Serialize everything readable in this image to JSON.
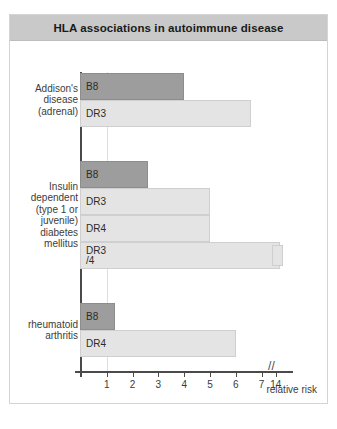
{
  "figure": {
    "title": "HLA associations in autoimmune disease",
    "axis_caption": "relative risk"
  },
  "chart_data": {
    "type": "bar",
    "orientation": "horizontal",
    "title": "HLA associations in autoimmune disease",
    "xlabel": "relative risk",
    "ylabel": "",
    "xlim": [
      0,
      7.9
    ],
    "xticks": [
      "1",
      "2",
      "3",
      "4",
      "5",
      "6",
      "7",
      "14"
    ],
    "axis_break": true,
    "axis_break_note": "//",
    "grid": "single vertical gridline at relative risk = 1",
    "groups": [
      {
        "label": "Addison's\ndisease\n(adrenal)",
        "bars": [
          {
            "allele": "B8",
            "value": 4.0,
            "shade": "dark"
          },
          {
            "allele": "DR3",
            "value": 6.6,
            "shade": "light"
          }
        ]
      },
      {
        "label": "Insulin\ndependent\n(type 1 or\njuvenile)\ndiabetes\nmellitus",
        "bars": [
          {
            "allele": "B8",
            "value": 2.6,
            "shade": "dark"
          },
          {
            "allele": "DR3",
            "value": 5.0,
            "shade": "light"
          },
          {
            "allele": "DR4",
            "value": 5.0,
            "shade": "light"
          },
          {
            "allele": "DR3\n/4",
            "value": 7.7,
            "shade": "light",
            "broken": true,
            "broken_value": 14
          }
        ]
      },
      {
        "label": "rheumatoid\narthritis",
        "bars": [
          {
            "allele": "B8",
            "value": 1.3,
            "shade": "dark"
          },
          {
            "allele": "DR4",
            "value": 6.0,
            "shade": "light"
          }
        ]
      }
    ],
    "colors": {
      "dark_bar": "#9d9d9d",
      "light_bar": "#e4e4e4",
      "axis": "#4a4a4a",
      "title_bar": "#c9c9c9",
      "gridline": "#dedede"
    }
  }
}
